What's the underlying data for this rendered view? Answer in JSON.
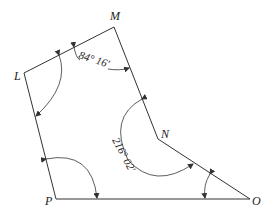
{
  "diagram": {
    "type": "polygon-angles",
    "vertices": [
      {
        "name": "M",
        "x": 114,
        "y": 27
      },
      {
        "name": "L",
        "x": 24,
        "y": 73
      },
      {
        "name": "P",
        "x": 56,
        "y": 199
      },
      {
        "name": "O",
        "x": 250,
        "y": 199
      },
      {
        "name": "N",
        "x": 158,
        "y": 139
      }
    ],
    "labels": {
      "M": "M",
      "L": "L",
      "P": "P",
      "O": "O",
      "N": "N"
    },
    "angle_labels": {
      "M": "84° 16′",
      "N": "216° 02′"
    }
  }
}
